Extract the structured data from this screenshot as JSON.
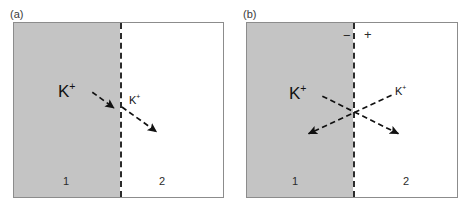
{
  "figure": {
    "width": 468,
    "height": 211,
    "background": "#ffffff",
    "shade_color": "#c4c4c4",
    "line_color": "#2b2b2b",
    "border_color": "#8c8c8c"
  },
  "panels": [
    {
      "id": "a",
      "label": "(a)",
      "label_x": 10,
      "label_y": 8,
      "box": {
        "x": 13,
        "y": 22,
        "w": 211,
        "h": 176
      },
      "membrane_x": 106,
      "shade_width": 106,
      "compartments": [
        {
          "name": "1",
          "x": 49,
          "y": 152
        },
        {
          "name": "2",
          "x": 145,
          "y": 152
        }
      ],
      "signs": [],
      "ions": [
        {
          "label": "K",
          "charge": "+",
          "size": "big",
          "x": 44,
          "y": 60
        },
        {
          "label": "K",
          "charge": "+",
          "size": "small",
          "x": 115,
          "y": 72
        }
      ],
      "arrows": [
        {
          "name": "influx-arrow",
          "x1": 79,
          "y1": 70,
          "x2": 101,
          "y2": 86
        },
        {
          "name": "efflux-arrow",
          "x1": 109,
          "y1": 85,
          "x2": 144,
          "y2": 110
        }
      ]
    },
    {
      "id": "b",
      "label": "(b)",
      "label_x": 243,
      "label_y": 8,
      "box": {
        "x": 246,
        "y": 22,
        "w": 212,
        "h": 176
      },
      "membrane_x": 106,
      "shade_width": 106,
      "compartments": [
        {
          "name": "1",
          "x": 45,
          "y": 152
        },
        {
          "name": "2",
          "x": 156,
          "y": 152
        }
      ],
      "signs": [
        {
          "name": "negative-sign",
          "text": "−",
          "x": 96,
          "y": 6
        },
        {
          "name": "positive-sign",
          "text": "+",
          "x": 117,
          "y": 5
        }
      ],
      "ions": [
        {
          "label": "K",
          "charge": "+",
          "size": "big",
          "x": 42,
          "y": 62
        },
        {
          "label": "K",
          "charge": "+",
          "size": "small",
          "x": 148,
          "y": 63
        }
      ],
      "arrows": [
        {
          "name": "outward-arrow",
          "x1": 76,
          "y1": 74,
          "x2": 153,
          "y2": 112
        },
        {
          "name": "inward-arrow",
          "x1": 146,
          "y1": 73,
          "x2": 62,
          "y2": 112
        }
      ]
    }
  ]
}
